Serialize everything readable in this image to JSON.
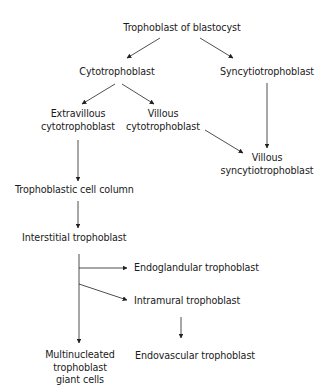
{
  "diagram": {
    "nodes": {
      "root": {
        "lines": [
          "Trophoblast of blastocyst"
        ]
      },
      "cyto": {
        "lines": [
          "Cytotrophoblast"
        ]
      },
      "syncytio": {
        "lines": [
          "Syncytiotrophoblast"
        ]
      },
      "extravillous": {
        "lines": [
          "Extravillous",
          "cytotrophoblast"
        ]
      },
      "villous_cyto": {
        "lines": [
          "Villous",
          "cytotrophoblast"
        ]
      },
      "villous_syncytio": {
        "lines": [
          "Villous",
          "syncytiotrophoblast"
        ]
      },
      "cell_column": {
        "lines": [
          "Trophoblastic cell column"
        ]
      },
      "interstitial": {
        "lines": [
          "Interstitial trophoblast"
        ]
      },
      "endoglandular": {
        "lines": [
          "Endoglandular trophoblast"
        ]
      },
      "intramural": {
        "lines": [
          "Intramural trophoblast"
        ]
      },
      "endovascular": {
        "lines": [
          "Endovascular trophoblast"
        ]
      },
      "giant_cells": {
        "lines": [
          "Multinucleated",
          "trophoblast",
          "giant cells"
        ]
      }
    },
    "edges": [
      {
        "from": "root",
        "to": "cyto"
      },
      {
        "from": "root",
        "to": "syncytio"
      },
      {
        "from": "cyto",
        "to": "extravillous"
      },
      {
        "from": "cyto",
        "to": "villous_cyto"
      },
      {
        "from": "syncytio",
        "to": "villous_syncytio"
      },
      {
        "from": "villous_cyto",
        "to": "villous_syncytio"
      },
      {
        "from": "extravillous",
        "to": "cell_column"
      },
      {
        "from": "cell_column",
        "to": "interstitial"
      },
      {
        "from": "interstitial",
        "to": "endoglandular"
      },
      {
        "from": "interstitial",
        "to": "intramural"
      },
      {
        "from": "interstitial",
        "to": "giant_cells"
      },
      {
        "from": "intramural",
        "to": "endovascular"
      }
    ],
    "colors": {
      "line": "#222222",
      "text": "#1a1a1a",
      "background": "#ffffff"
    }
  }
}
